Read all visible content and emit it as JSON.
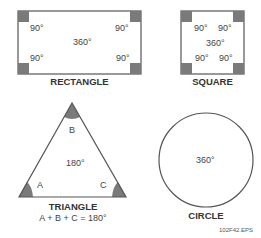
{
  "shapes": {
    "rectangle": {
      "title": "RECTANGLE",
      "corners": [
        "90°",
        "90°",
        "90°",
        "90°"
      ],
      "total": "360°"
    },
    "square": {
      "title": "SQUARE",
      "corners": [
        "90°",
        "90°",
        "90°",
        "90°"
      ],
      "total": "360°"
    },
    "triangle": {
      "title": "TRIANGLE",
      "angles": [
        "A",
        "B",
        "C"
      ],
      "total": "180°",
      "formula": "A + B + C = 180°"
    },
    "circle": {
      "title": "CIRCLE",
      "total": "360°"
    }
  },
  "figure_id": "102F42.EPS",
  "colors": {
    "outline": "#555555",
    "angle_fill": "#7a7a7a"
  }
}
